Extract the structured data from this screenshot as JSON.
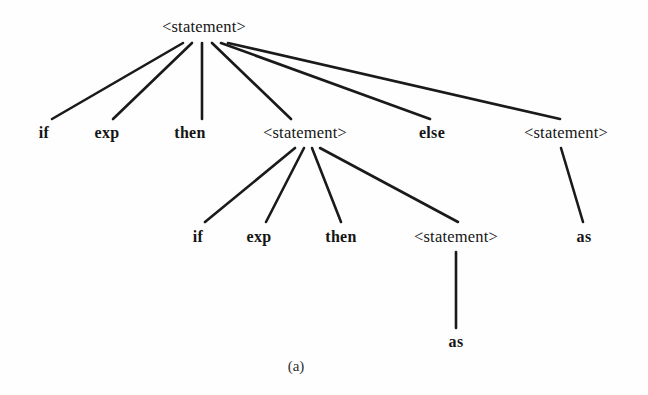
{
  "figure": {
    "caption": "(a)",
    "caption_x": 296,
    "caption_y": 366,
    "width": 648,
    "height": 395,
    "background_color": "#fefefe",
    "line_color": "#1a1a1a",
    "text_color": "#151515"
  },
  "nodes": [
    {
      "id": "n0",
      "label": "<statement>",
      "kind": "nonterminal",
      "x": 204,
      "y": 27,
      "level": 0
    },
    {
      "id": "n1",
      "label": "if",
      "kind": "terminal",
      "x": 44,
      "y": 133,
      "level": 1
    },
    {
      "id": "n2",
      "label": "exp",
      "kind": "terminal",
      "x": 107,
      "y": 133,
      "level": 1
    },
    {
      "id": "n3",
      "label": "then",
      "kind": "terminal",
      "x": 190,
      "y": 133,
      "level": 1
    },
    {
      "id": "n4",
      "label": "<statement>",
      "kind": "nonterminal",
      "x": 305,
      "y": 133,
      "level": 1
    },
    {
      "id": "n5",
      "label": "else",
      "kind": "terminal",
      "x": 432,
      "y": 133,
      "level": 1
    },
    {
      "id": "n6",
      "label": "<statement>",
      "kind": "nonterminal",
      "x": 566,
      "y": 133,
      "level": 1
    },
    {
      "id": "n7",
      "label": "if",
      "kind": "terminal",
      "x": 198,
      "y": 237,
      "level": 2
    },
    {
      "id": "n8",
      "label": "exp",
      "kind": "terminal",
      "x": 259,
      "y": 237,
      "level": 2
    },
    {
      "id": "n9",
      "label": "then",
      "kind": "terminal",
      "x": 341,
      "y": 237,
      "level": 2
    },
    {
      "id": "n10",
      "label": "<statement>",
      "kind": "nonterminal",
      "x": 456,
      "y": 237,
      "level": 2
    },
    {
      "id": "n11",
      "label": "as",
      "kind": "terminal",
      "x": 584,
      "y": 237,
      "level": 2
    },
    {
      "id": "n12",
      "label": "as",
      "kind": "terminal",
      "x": 456,
      "y": 342,
      "level": 3
    }
  ],
  "edges": [
    {
      "from": "n0",
      "to": "n1",
      "x1": 183,
      "y1": 43,
      "x2": 52,
      "y2": 119
    },
    {
      "from": "n0",
      "to": "n2",
      "x1": 192,
      "y1": 43,
      "x2": 113,
      "y2": 119
    },
    {
      "from": "n0",
      "to": "n3",
      "x1": 202,
      "y1": 43,
      "x2": 202,
      "y2": 119
    },
    {
      "from": "n0",
      "to": "n4",
      "x1": 212,
      "y1": 43,
      "x2": 291,
      "y2": 119
    },
    {
      "from": "n0",
      "to": "n5",
      "x1": 221,
      "y1": 43,
      "x2": 430,
      "y2": 119
    },
    {
      "from": "n0",
      "to": "n6",
      "x1": 228,
      "y1": 43,
      "x2": 560,
      "y2": 119
    },
    {
      "from": "n4",
      "to": "n7",
      "x1": 295,
      "y1": 148,
      "x2": 205,
      "y2": 222
    },
    {
      "from": "n4",
      "to": "n8",
      "x1": 304,
      "y1": 148,
      "x2": 266,
      "y2": 222
    },
    {
      "from": "n4",
      "to": "n9",
      "x1": 312,
      "y1": 148,
      "x2": 341,
      "y2": 222
    },
    {
      "from": "n4",
      "to": "n10",
      "x1": 320,
      "y1": 148,
      "x2": 458,
      "y2": 222
    },
    {
      "from": "n6",
      "to": "n11",
      "x1": 561,
      "y1": 148,
      "x2": 583,
      "y2": 222
    },
    {
      "from": "n10",
      "to": "n12",
      "x1": 456,
      "y1": 252,
      "x2": 456,
      "y2": 328
    }
  ]
}
